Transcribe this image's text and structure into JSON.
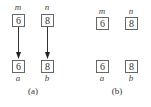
{
  "panels": [
    {
      "caption": "(a)",
      "top_boxes": [
        {
          "label": "m",
          "value": "6"
        },
        {
          "label": "n",
          "value": "8"
        }
      ],
      "bottom_boxes": [
        {
          "label": "a",
          "value": "6"
        },
        {
          "label": "b",
          "value": "8"
        }
      ],
      "arrows": [
        {
          "from": "m",
          "to": "a"
        },
        {
          "from": "n",
          "to": "b"
        }
      ]
    },
    {
      "caption": "(b)",
      "top_boxes": [
        {
          "label": "m",
          "value": "6"
        },
        {
          "label": "n",
          "value": "8"
        }
      ],
      "bottom_boxes": [
        {
          "label": "a",
          "value": "6"
        },
        {
          "label": "b",
          "value": "8"
        }
      ],
      "arrows": []
    }
  ]
}
